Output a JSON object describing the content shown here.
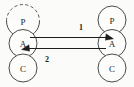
{
  "diagram": {
    "type": "pac-agent-communication",
    "background_color": "#fbfbfa",
    "stroke_color": "#4a4a4a",
    "agents": [
      {
        "id": "left-agent",
        "position": "left",
        "nodes": [
          {
            "key": "presentation",
            "label": "P",
            "outline": "dashed-top-arc"
          },
          {
            "key": "abstraction",
            "label": "A",
            "outline": "solid"
          },
          {
            "key": "control",
            "label": "C",
            "outline": "solid"
          }
        ]
      },
      {
        "id": "right-agent",
        "position": "right",
        "nodes": [
          {
            "key": "presentation",
            "label": "P",
            "outline": "solid"
          },
          {
            "key": "abstraction",
            "label": "A",
            "outline": "solid"
          },
          {
            "key": "control",
            "label": "C",
            "outline": "solid"
          }
        ]
      }
    ],
    "links": [
      {
        "id": "link-1",
        "label": "1",
        "direction": "left-to-right",
        "from": "left-agent.abstraction",
        "to": "right-agent.abstraction",
        "label_position": "above-right"
      },
      {
        "id": "link-2",
        "label": "2",
        "direction": "right-to-left",
        "from": "right-agent.abstraction",
        "to": "left-agent.abstraction",
        "label_position": "below-left"
      }
    ]
  }
}
